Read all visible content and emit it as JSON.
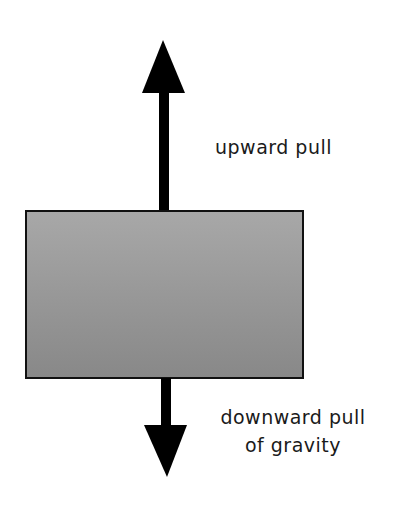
{
  "diagram": {
    "type": "force-diagram",
    "object": {
      "shape": "rectangle",
      "fill_top": "#a6a6a6",
      "fill_bottom": "#8a8a8a",
      "stroke": "#111111"
    },
    "forces": [
      {
        "direction": "up",
        "label": "upward pull"
      },
      {
        "direction": "down",
        "label_line1": "downward pull",
        "label_line2": "of gravity"
      }
    ],
    "colors": {
      "arrow": "#000000",
      "text": "#1a1a1a",
      "background": "#ffffff"
    }
  }
}
